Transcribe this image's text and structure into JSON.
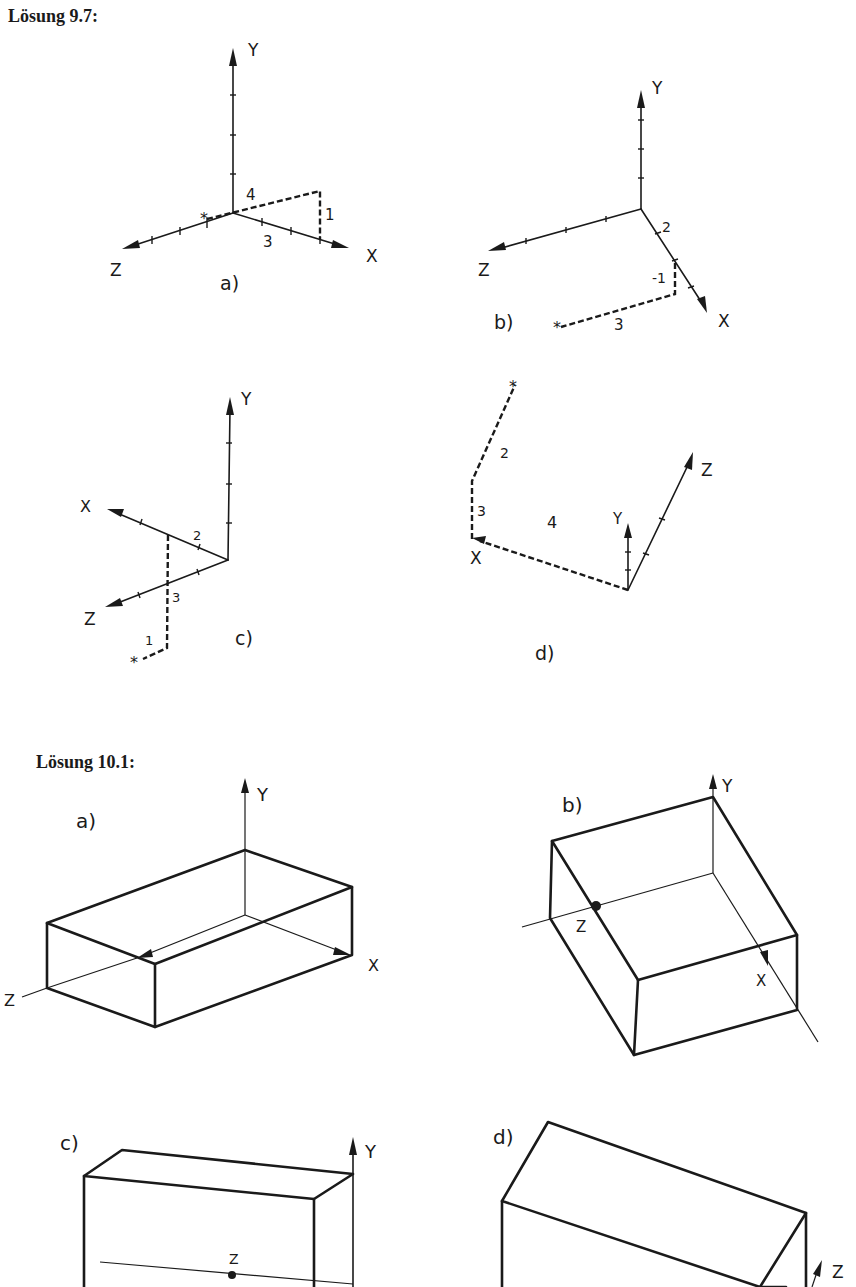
{
  "headings": {
    "solution_9_7": "Lösung 9.7:",
    "solution_10_1": "Lösung 10.1:"
  },
  "solution_9_7": {
    "a": {
      "label": "a)",
      "axes": {
        "x": "X",
        "y": "Y",
        "z": "Z"
      },
      "path_values": {
        "first": "4",
        "second": "3",
        "third": "1"
      },
      "point_marker": "*"
    },
    "b": {
      "label": "b)",
      "axes": {
        "x": "X",
        "y": "Y",
        "z": "Z"
      },
      "path_values": {
        "first": "2",
        "second": "-1",
        "third": "3"
      },
      "point_marker": "*"
    },
    "c": {
      "label": "c)",
      "axes": {
        "x": "X",
        "y": "Y",
        "z": "Z"
      },
      "path_values": {
        "first": "2",
        "second": "3",
        "third": "1"
      },
      "point_marker": "*"
    },
    "d": {
      "label": "d)",
      "axes": {
        "x": "X",
        "y": "Y",
        "z": "Z"
      },
      "path_values": {
        "first": "4",
        "second": "3",
        "third": "2"
      },
      "point_marker": "*"
    }
  },
  "solution_10_1": {
    "a": {
      "label": "a)",
      "axes": {
        "x": "X",
        "y": "Y",
        "z": "Z"
      }
    },
    "b": {
      "label": "b)",
      "axes": {
        "x": "X",
        "y": "Y",
        "z": "Z"
      }
    },
    "c": {
      "label": "c)",
      "axes": {
        "y": "Y",
        "z": "Z"
      }
    },
    "d": {
      "label": "d)",
      "axes": {
        "z": "Z"
      }
    }
  }
}
